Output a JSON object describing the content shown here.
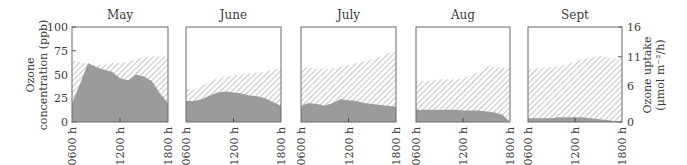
{
  "chart_data": {
    "type": "area",
    "left_axis": {
      "label_line1": "Ozone",
      "label_line2": "concentration (ppb)",
      "ticks": [
        "0",
        "25",
        "50",
        "75",
        "100"
      ],
      "range": [
        0,
        100
      ]
    },
    "right_axis": {
      "label_line1": "Ozone uptake",
      "label_line2": "(μmol m⁻²/h)",
      "ticks": [
        "0",
        "6",
        "11",
        "16"
      ],
      "range": [
        0,
        16
      ]
    },
    "x_ticks": [
      "0600 h",
      "1200 h",
      "1800 h"
    ],
    "x_hours": [
      6,
      7,
      8,
      9,
      10,
      11,
      12,
      13,
      14,
      15,
      16,
      17,
      18
    ],
    "series_legend": {
      "hatched": "Ozone concentration (ppb)",
      "grey": "Ozone uptake (scaled to right axis)"
    },
    "panels": [
      {
        "title": "May",
        "concentration_ppb": [
          65,
          63,
          61,
          60,
          61,
          62,
          62,
          63,
          66,
          69,
          69,
          69,
          69
        ],
        "uptake_ppb_scale": [
          20,
          40,
          62,
          58,
          55,
          53,
          46,
          44,
          50,
          48,
          43,
          30,
          20
        ]
      },
      {
        "title": "June",
        "concentration_ppb": [
          35,
          34,
          38,
          43,
          46,
          48,
          49,
          50,
          51,
          52,
          53,
          55,
          57
        ],
        "uptake_ppb_scale": [
          22,
          22,
          24,
          28,
          31,
          32,
          31,
          30,
          28,
          27,
          25,
          21,
          17
        ]
      },
      {
        "title": "July",
        "concentration_ppb": [
          58,
          57,
          56,
          56,
          56,
          58,
          60,
          62,
          64,
          66,
          69,
          72,
          75
        ],
        "uptake_ppb_scale": [
          17,
          20,
          19,
          17,
          20,
          24,
          23,
          22,
          20,
          19,
          18,
          17,
          16
        ]
      },
      {
        "title": "Aug",
        "concentration_ppb": [
          43,
          43,
          44,
          45,
          45,
          45,
          46,
          49,
          53,
          59,
          58,
          57,
          57
        ],
        "uptake_ppb_scale": [
          13,
          13,
          13,
          13,
          13,
          13,
          12,
          12,
          12,
          11,
          10,
          8,
          0
        ]
      },
      {
        "title": "Sept",
        "concentration_ppb": [
          55,
          56,
          57,
          58,
          59,
          61,
          64,
          66,
          68,
          70,
          68,
          67,
          68
        ],
        "uptake_ppb_scale": [
          4,
          4,
          4,
          4,
          5,
          5,
          5,
          5,
          4,
          3,
          2,
          1,
          1
        ]
      }
    ]
  }
}
